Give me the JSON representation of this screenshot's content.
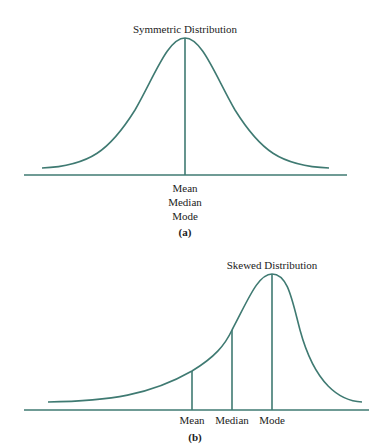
{
  "colors": {
    "line": "#3f7a72",
    "text": "#222222"
  },
  "panel_a": {
    "title": "Symmetric Distribution",
    "labels": [
      "Mean",
      "Median",
      "Mode"
    ],
    "caption": "(a)"
  },
  "panel_b": {
    "title": "Skewed Distribution",
    "labels": {
      "mean": "Mean",
      "median": "Median",
      "mode": "Mode"
    },
    "caption": "(b)"
  }
}
